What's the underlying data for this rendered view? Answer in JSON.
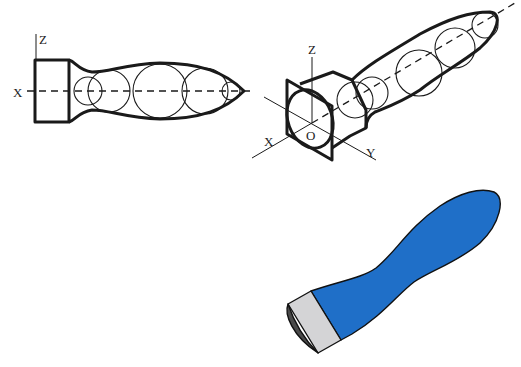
{
  "diagram": {
    "type": "technical-illustration",
    "views": [
      {
        "name": "side-view",
        "axis_labels": {
          "z": "Z",
          "x": "X"
        },
        "circle_count": 5
      },
      {
        "name": "isometric-view",
        "axis_labels": {
          "z": "Z",
          "x": "X",
          "y": "Y",
          "origin": "O"
        },
        "circle_count": 6
      },
      {
        "name": "rendered-view",
        "colors": {
          "handle": "#1f6fc8",
          "ferrule": "#d4d4d6",
          "end_face": "#4a4a4a",
          "outline": "#111111"
        }
      }
    ]
  }
}
